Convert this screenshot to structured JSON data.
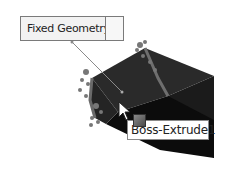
{
  "viewport": {
    "model_name": "Boss-Extrude1",
    "colors": {
      "top_face": "#2b2b2b",
      "front_face": "#0d0d0d",
      "right_face": "#1a1a1a",
      "fixture_marker": "#7a7a7a",
      "background": "#ffffff"
    }
  },
  "callout": {
    "label": "Fixed Geometry:",
    "value": ""
  },
  "tooltip": {
    "label": "Boss-Extrude1",
    "icon": "extrude-feature-icon"
  },
  "cursor": {
    "icon": "arrow-pointer-icon"
  }
}
